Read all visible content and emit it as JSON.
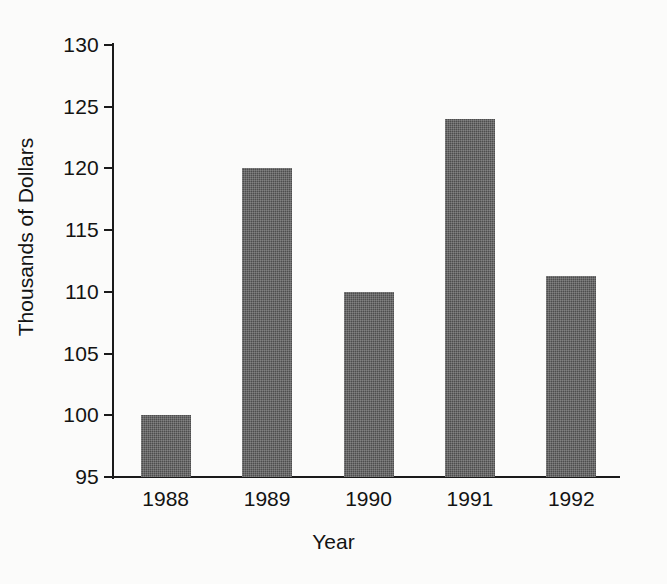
{
  "chart_data": {
    "type": "bar",
    "title": "",
    "xlabel": "Year",
    "ylabel": "Thousands of Dollars",
    "categories": [
      "1988",
      "1989",
      "1990",
      "1991",
      "1992"
    ],
    "values": [
      100,
      120,
      110,
      124,
      111.3
    ],
    "ylim": [
      95,
      130
    ],
    "yticks": [
      95,
      100,
      105,
      110,
      115,
      120,
      125,
      130
    ],
    "ytick_labels": [
      "95",
      "100",
      "105",
      "110",
      "115",
      "120",
      "125",
      "130"
    ],
    "grid": false,
    "legend": null,
    "bar_color": "#4d4d4d",
    "background_color": "#fbfbfa",
    "axis_color": "#1a1a1a"
  }
}
